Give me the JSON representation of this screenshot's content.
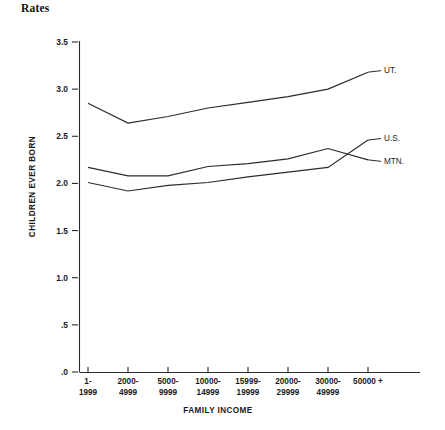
{
  "chart_data": {
    "type": "line",
    "title": "Rates",
    "xlabel": "FAMILY INCOME",
    "ylabel": "CHILDREN EVER BORN",
    "categories": [
      "1-\n1999",
      "2000-\n4999",
      "5000-\n9999",
      "10000-\n14999",
      "15999-\n19999",
      "20000-\n29999",
      "30000-\n49999",
      "50000 +"
    ],
    "category_lines": [
      [
        "1-",
        "1999"
      ],
      [
        "2000-",
        "4999"
      ],
      [
        "5000-",
        "9999"
      ],
      [
        "10000-",
        "14999"
      ],
      [
        "15999-",
        "19999"
      ],
      [
        "20000-",
        "29999"
      ],
      [
        "30000-",
        "49999"
      ],
      [
        "50000 +",
        ""
      ]
    ],
    "ylim": [
      0,
      3.5
    ],
    "ytick_labels": [
      "3.5",
      "3.0",
      "2.5",
      "2.0",
      "1.5",
      "1.0",
      ".5",
      ".0"
    ],
    "ytick_values": [
      3.5,
      3.0,
      2.5,
      2.0,
      1.5,
      1.0,
      0.5,
      0.0
    ],
    "grid": false,
    "legend_position": "right-inline",
    "series": [
      {
        "name": "UT.",
        "values": [
          2.85,
          2.64,
          2.71,
          2.8,
          2.86,
          2.92,
          3.0,
          3.18
        ]
      },
      {
        "name": "MTN.",
        "values": [
          2.17,
          2.08,
          2.08,
          2.18,
          2.21,
          2.26,
          2.37,
          2.25
        ]
      },
      {
        "name": "U.S.",
        "values": [
          2.01,
          1.92,
          1.98,
          2.01,
          2.07,
          2.12,
          2.17,
          2.46
        ]
      }
    ],
    "line_color": "#2b2b2b"
  },
  "labels": {
    "ut": "UT.",
    "us": "U.S.",
    "mtn": "MTN."
  }
}
